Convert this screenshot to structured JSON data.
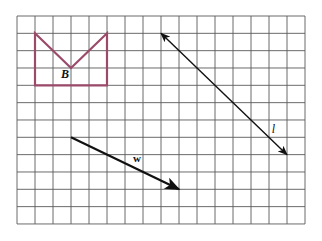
{
  "diagram": {
    "type": "grid-geometry",
    "grid": {
      "columns": 16,
      "rows": 12,
      "origin_px": [
        17,
        16
      ],
      "cell_w": 18,
      "cell_h": 17.33,
      "line_color": "#5a5a5a"
    },
    "shape_b": {
      "label": "B",
      "color": "#9b4a6a",
      "vertices_grid": [
        [
          1,
          1
        ],
        [
          3,
          3
        ],
        [
          5,
          1
        ],
        [
          5,
          4
        ],
        [
          1,
          4
        ]
      ],
      "label_pos_grid": [
        2.45,
        3.55
      ]
    },
    "line_l": {
      "label": "l",
      "color": "#111111",
      "from_grid": [
        8,
        1
      ],
      "to_grid": [
        15,
        8
      ],
      "double_arrow": true,
      "label_pos_grid": [
        14.15,
        6.75
      ]
    },
    "vector_w": {
      "label": "w",
      "color": "#111111",
      "from_grid": [
        3,
        7
      ],
      "to_grid": [
        9,
        10
      ],
      "arrow_at_end": true,
      "label_pos_grid": [
        6.45,
        8.45
      ]
    }
  }
}
